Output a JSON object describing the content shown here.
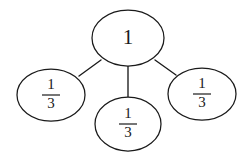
{
  "diagram": {
    "type": "fraction-part-whole-tree",
    "colors": {
      "background": "#ffffff",
      "stroke": "#1a1a1a",
      "node_fill": "#ffffff",
      "text": "#1a1a1a"
    },
    "root": {
      "id": "whole",
      "label": "1",
      "value": "1",
      "cx": 128,
      "cy": 38,
      "rx": 36,
      "ry": 28
    },
    "children": [
      {
        "id": "third-left",
        "label": "1/3",
        "numerator": "1",
        "denominator": "3",
        "cx": 51,
        "cy": 95,
        "rx": 34,
        "ry": 26
      },
      {
        "id": "third-bottom",
        "label": "1/3",
        "numerator": "1",
        "denominator": "3",
        "cx": 128,
        "cy": 124,
        "rx": 33,
        "ry": 27
      },
      {
        "id": "third-right",
        "label": "1/3",
        "numerator": "1",
        "denominator": "3",
        "cx": 202,
        "cy": 94,
        "rx": 34,
        "ry": 26
      }
    ],
    "connectors": [
      {
        "id": "edge-left",
        "x1": 101,
        "y1": 60,
        "x2": 79,
        "y2": 76
      },
      {
        "id": "edge-middle",
        "x1": 128,
        "y1": 66,
        "x2": 128,
        "y2": 98
      },
      {
        "id": "edge-right",
        "x1": 155,
        "y1": 60,
        "x2": 176,
        "y2": 75
      }
    ]
  }
}
